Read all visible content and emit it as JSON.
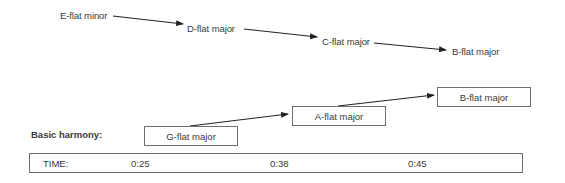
{
  "top_progression": {
    "chords": [
      {
        "label": "E-flat minor"
      },
      {
        "label": "D-flat major"
      },
      {
        "label": "C-flat major"
      },
      {
        "label": "B-flat major"
      }
    ]
  },
  "basic_harmony": {
    "label": "Basic harmony:",
    "chords": [
      {
        "label": "G-flat major"
      },
      {
        "label": "A-flat major"
      },
      {
        "label": "B-flat major"
      }
    ]
  },
  "timeline": {
    "label": "TIME:",
    "marks": [
      "0:25",
      "0:38",
      "0:45"
    ]
  },
  "colors": {
    "text": "#3a3a3a",
    "line": "#222222",
    "box_border": "#6e6e6e"
  }
}
